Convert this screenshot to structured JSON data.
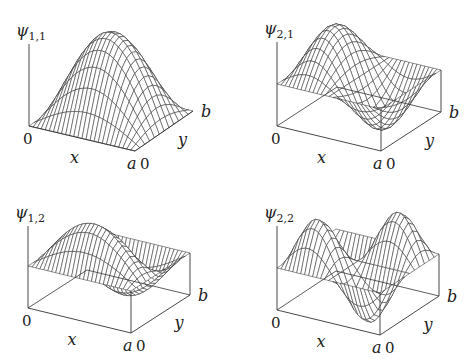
{
  "figure": {
    "line_color": "#333333",
    "grid": {
      "nu": 26,
      "nv": 12
    }
  },
  "panels": [
    {
      "id": "psi11",
      "title": {
        "symbol": "ψ",
        "subscript": "1,1"
      },
      "m": 1,
      "n": 1,
      "origin": [
        29,
        126
      ],
      "corner_a": [
        135,
        151
      ],
      "corner_ab": [
        193,
        111
      ],
      "lift": 0,
      "amp": 86,
      "box": false,
      "axis_top": 44,
      "labels": {
        "origin": "0",
        "x": "x",
        "a": "a",
        "y_zero": "0",
        "y": "y",
        "b": "b"
      }
    },
    {
      "id": "psi21",
      "title": {
        "symbol": "ψ",
        "subscript": "2,1"
      },
      "m": 2,
      "n": 1,
      "origin": [
        277,
        126
      ],
      "corner_a": [
        381,
        151
      ],
      "corner_ab": [
        441,
        112
      ],
      "lift": 42,
      "amp": 45,
      "box": true,
      "axis_top": 42,
      "labels": {
        "origin": "0",
        "x": "x",
        "a": "a",
        "y_zero": "0",
        "y": "y",
        "b": "b"
      }
    },
    {
      "id": "psi12",
      "title": {
        "symbol": "ψ",
        "subscript": "1,2"
      },
      "m": 1,
      "n": 2,
      "origin": [
        28,
        308
      ],
      "corner_a": [
        131,
        333
      ],
      "corner_ab": [
        190,
        295
      ],
      "lift": 42,
      "amp": 45,
      "box": true,
      "axis_top": 226,
      "labels": {
        "origin": "0",
        "x": "x",
        "a": "a",
        "y_zero": "0",
        "y": "y",
        "b": "b"
      }
    },
    {
      "id": "psi22",
      "title": {
        "symbol": "ψ",
        "subscript": "2,2"
      },
      "m": 2,
      "n": 2,
      "origin": [
        277,
        310
      ],
      "corner_a": [
        380,
        335
      ],
      "corner_ab": [
        439,
        296
      ],
      "lift": 42,
      "amp": 45,
      "box": true,
      "axis_top": 226,
      "labels": {
        "origin": "0",
        "x": "x",
        "a": "a",
        "y_zero": "0",
        "y": "y",
        "b": "b"
      }
    }
  ]
}
